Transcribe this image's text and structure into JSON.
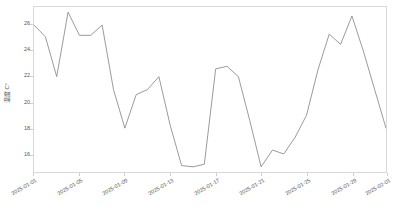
{
  "chart_data": {
    "type": "line",
    "title": "",
    "xlabel": "",
    "ylabel": "温度 C°",
    "ylim": [
      14.6,
      27.4
    ],
    "grid": false,
    "legend": "none",
    "line_color": "#808080",
    "frame_color": "#d9d9d9",
    "tick_color": "#555555",
    "y_ticks": [
      16,
      18,
      20,
      22,
      24,
      26
    ],
    "x_ticks": [
      "2025-01-01",
      "2025-01-05",
      "2025-01-09",
      "2025-01-13",
      "2025-01-17",
      "2025-01-21",
      "2025-01-25",
      "2025-01-29",
      "2025-02-01"
    ],
    "x": [
      "2025-01-01",
      "2025-01-02",
      "2025-01-03",
      "2025-01-04",
      "2025-01-05",
      "2025-01-06",
      "2025-01-07",
      "2025-01-08",
      "2025-01-09",
      "2025-01-10",
      "2025-01-11",
      "2025-01-12",
      "2025-01-13",
      "2025-01-14",
      "2025-01-15",
      "2025-01-16",
      "2025-01-17",
      "2025-01-18",
      "2025-01-19",
      "2025-01-20",
      "2025-01-21",
      "2025-01-22",
      "2025-01-23",
      "2025-01-24",
      "2025-01-25",
      "2025-01-26",
      "2025-01-27",
      "2025-01-28",
      "2025-01-29",
      "2025-01-30",
      "2025-01-31",
      "2025-02-01"
    ],
    "values": [
      26.0,
      25.1,
      22.0,
      27.0,
      25.2,
      25.2,
      26.0,
      21.0,
      18.0,
      20.6,
      21.0,
      22.0,
      18.2,
      15.1,
      15.0,
      15.2,
      22.6,
      22.8,
      22.0,
      18.6,
      15.0,
      16.3,
      16.0,
      17.3,
      19.0,
      22.5,
      25.3,
      24.5,
      26.7,
      24.0,
      21.0,
      18.0
    ],
    "series_name": "温度"
  }
}
